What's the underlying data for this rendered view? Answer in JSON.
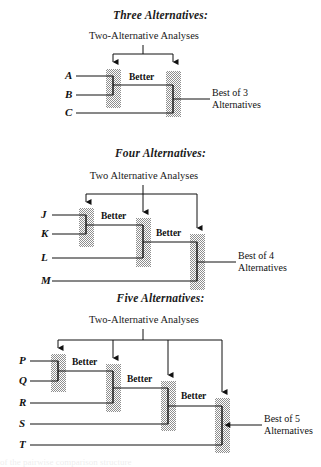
{
  "figure": {
    "bg_color": "#ffffff",
    "ink_color": "#111111",
    "hatch_color": "#8c8c8c",
    "groups": [
      {
        "id": "three-alternatives",
        "title": "Three Alternatives:",
        "subtitle": "Two-Alternative Analyses",
        "alternatives": [
          "A",
          "B",
          "C"
        ],
        "comparison_labels": [
          "Better"
        ],
        "result_label_line1": "Best of 3",
        "result_label_line2": "Alternatives",
        "analysis_count": 2
      },
      {
        "id": "four-alternatives",
        "title": "Four Alternatives:",
        "subtitle": "Two Alternative Analyses",
        "alternatives": [
          "J",
          "K",
          "L",
          "M"
        ],
        "comparison_labels": [
          "Better",
          "Better"
        ],
        "result_label_line1": "Best of 4",
        "result_label_line2": "Alternatives",
        "analysis_count": 3
      },
      {
        "id": "five-alternatives",
        "title": "Five Alternatives:",
        "subtitle": "Two-Alternative Analyses",
        "alternatives": [
          "P",
          "Q",
          "R",
          "S",
          "T"
        ],
        "comparison_labels": [
          "Better",
          "Better",
          "Better"
        ],
        "result_label_line1": "Best of 5",
        "result_label_line2": "Alternatives",
        "analysis_count": 4
      }
    ],
    "footer_fragment": "of the pairwise comparison structure"
  }
}
